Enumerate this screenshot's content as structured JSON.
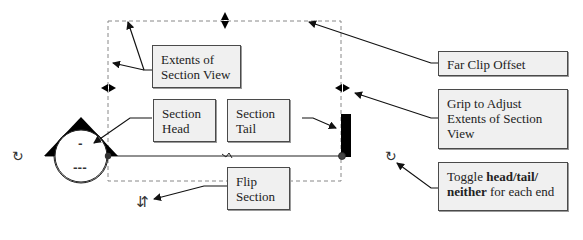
{
  "diagram": {
    "callouts": {
      "extents": {
        "text": "Extents of Section View"
      },
      "section_head": {
        "text": "Section Head"
      },
      "section_tail": {
        "text": "Section Tail"
      },
      "far_clip": {
        "text": "Far Clip Offset"
      },
      "grip_adjust": {
        "text": "Grip to Adjust Extents of Section View"
      },
      "flip": {
        "text": "Flip Section"
      },
      "toggle": {
        "prefix": "Toggle ",
        "bold1": "head/tail/",
        "bold2": "neither",
        "suffix": " for each end"
      }
    },
    "head_symbol": {
      "top_label": "-",
      "bottom_label": "---"
    },
    "icons": {
      "cycle_left": "↻",
      "cycle_right": "↻",
      "flip": "⇵",
      "break": "⌁"
    },
    "colors": {
      "callout_fill": "#f0f0f0",
      "callout_border": "#4a4a4a",
      "line": "#222222",
      "dashed": "#888888"
    }
  }
}
